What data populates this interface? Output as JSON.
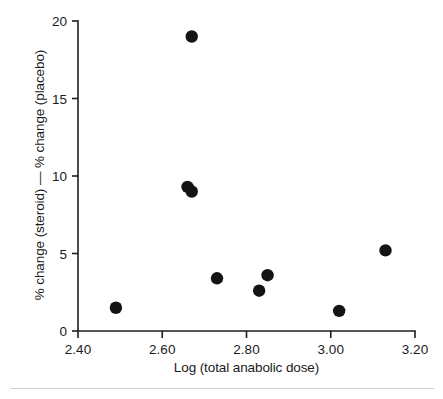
{
  "chart_data": {
    "type": "scatter",
    "title": "",
    "xlabel": "Log (total anabolic dose)",
    "ylabel": "% change (steroid) — % change (placebo)",
    "xlim": [
      2.4,
      3.2
    ],
    "ylim": [
      0,
      20
    ],
    "xticks": [
      "2.40",
      "2.60",
      "2.80",
      "3.00",
      "3.20"
    ],
    "xtick_values": [
      2.4,
      2.6,
      2.8,
      3.0,
      3.2
    ],
    "yticks": [
      "0",
      "5",
      "10",
      "15",
      "20"
    ],
    "ytick_values": [
      0,
      5,
      10,
      15,
      20
    ],
    "grid": false,
    "legend": false,
    "marker": "filled-circle",
    "marker_color": "#141414",
    "marker_size": 6.2,
    "points": [
      {
        "x": 2.49,
        "y": 1.5
      },
      {
        "x": 2.66,
        "y": 9.3
      },
      {
        "x": 2.67,
        "y": 19.0
      },
      {
        "x": 2.67,
        "y": 9.0
      },
      {
        "x": 2.73,
        "y": 3.4
      },
      {
        "x": 2.83,
        "y": 2.6
      },
      {
        "x": 2.85,
        "y": 3.6
      },
      {
        "x": 3.02,
        "y": 1.3
      },
      {
        "x": 3.13,
        "y": 5.2
      }
    ]
  },
  "colors": {
    "axis": "#1d1d1d",
    "marker": "#141414",
    "rule": "#d2d2d2",
    "background": "#ffffff"
  }
}
